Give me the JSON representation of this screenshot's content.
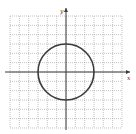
{
  "chart_data": {
    "type": "line",
    "title": "",
    "xlabel": "x",
    "ylabel": "y",
    "xlim": [
      -6,
      6
    ],
    "ylim": [
      -6,
      6
    ],
    "grid": true,
    "grid_step": 1,
    "series": [
      {
        "name": "circle",
        "shape": "circle",
        "center": [
          0,
          0
        ],
        "radius": 3,
        "equation": "x^2 + y^2 = 9"
      }
    ],
    "colors": {
      "curve": "#3c3c3c",
      "axes": "#3a3a3a",
      "grid": "#9a9a9a"
    }
  }
}
